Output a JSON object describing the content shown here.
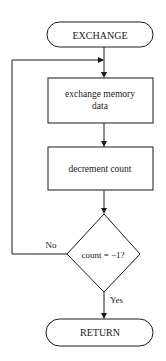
{
  "flowchart": {
    "start": {
      "label": "EXCHANGE"
    },
    "steps": [
      {
        "label_line1": "exchange memory",
        "label_line2": "data"
      },
      {
        "label": "decrement count"
      }
    ],
    "decision": {
      "label": "count = −1?",
      "no_label": "No",
      "yes_label": "Yes"
    },
    "end": {
      "label": "RETURN"
    }
  }
}
